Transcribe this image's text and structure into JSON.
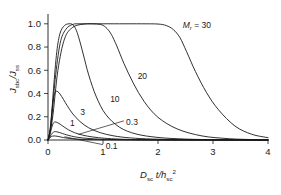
{
  "chart_data": {
    "type": "line",
    "title": "",
    "subtitle": "",
    "xlabel": "D_sc t/h_sc^2",
    "ylabel": "J_sbc/J_ss",
    "xlabel_parts": {
      "main1": "D",
      "sub1": "sc",
      "main2": "t/h",
      "sub2": "sc",
      "sup2": "2"
    },
    "ylabel_parts": {
      "main1": "J",
      "sub1": "sbc",
      "main2": "/J",
      "sub2": "ss"
    },
    "xlim": [
      0,
      4
    ],
    "ylim": [
      0,
      1.05
    ],
    "xticks": [
      "0",
      "1",
      "2",
      "3",
      "4"
    ],
    "xtick_values": [
      0,
      1,
      2,
      3,
      4
    ],
    "yticks": [
      "0.0",
      "0.2",
      "0.4",
      "0.6",
      "0.8",
      "1.0"
    ],
    "ytick_values": [
      0.0,
      0.2,
      0.4,
      0.6,
      0.8,
      1.0
    ],
    "grid": false,
    "legend_position": "inline-annotations",
    "legend_title": "M_r",
    "legend_title_parts": {
      "main": "M",
      "sub": "r"
    },
    "series": [
      {
        "name": "0.1",
        "label": "0.1",
        "peak": 0.035,
        "x": [
          0,
          0.02,
          0.05,
          0.08,
          0.11,
          0.14,
          0.18,
          0.22,
          0.28,
          0.35,
          0.45,
          0.6,
          0.8,
          1.0,
          1.3,
          1.7,
          2.2,
          2.8,
          3.4,
          4.0
        ],
        "values": [
          0,
          0.012,
          0.026,
          0.033,
          0.035,
          0.034,
          0.031,
          0.027,
          0.021,
          0.016,
          0.01,
          0.006,
          0.003,
          0.0015,
          0.0007,
          0.0003,
          0.0001,
          0.0001,
          0,
          0
        ]
      },
      {
        "name": "0.3",
        "label": "0.3",
        "peak": 0.072,
        "x": [
          0,
          0.03,
          0.06,
          0.1,
          0.14,
          0.18,
          0.23,
          0.3,
          0.38,
          0.48,
          0.62,
          0.8,
          1.0,
          1.3,
          1.6,
          2.0,
          2.5,
          3.0,
          3.5,
          4.0
        ],
        "values": [
          0,
          0.02,
          0.048,
          0.068,
          0.072,
          0.068,
          0.061,
          0.05,
          0.039,
          0.028,
          0.018,
          0.011,
          0.006,
          0.003,
          0.0015,
          0.0007,
          0.0003,
          0.0001,
          0,
          0
        ]
      },
      {
        "name": "1",
        "label": "1",
        "peak": 0.155,
        "x": [
          0,
          0.03,
          0.06,
          0.09,
          0.12,
          0.16,
          0.2,
          0.26,
          0.33,
          0.42,
          0.55,
          0.72,
          0.92,
          1.15,
          1.45,
          1.8,
          2.3,
          2.8,
          3.4,
          4.0
        ],
        "values": [
          0,
          0.035,
          0.095,
          0.138,
          0.155,
          0.152,
          0.142,
          0.123,
          0.1,
          0.076,
          0.052,
          0.033,
          0.02,
          0.011,
          0.005,
          0.0022,
          0.0008,
          0.0003,
          0.0001,
          0
        ]
      },
      {
        "name": "3",
        "label": "3",
        "peak": 0.42,
        "x": [
          0,
          0.03,
          0.06,
          0.09,
          0.12,
          0.15,
          0.18,
          0.22,
          0.28,
          0.35,
          0.45,
          0.58,
          0.74,
          0.95,
          1.2,
          1.5,
          1.9,
          2.4,
          3.0,
          3.6,
          4.0
        ],
        "values": [
          0,
          0.06,
          0.2,
          0.33,
          0.4,
          0.42,
          0.415,
          0.395,
          0.35,
          0.295,
          0.225,
          0.16,
          0.105,
          0.063,
          0.035,
          0.018,
          0.008,
          0.003,
          0.001,
          0.0002,
          0
        ]
      },
      {
        "name": "10",
        "label": "10",
        "peak": 1.0,
        "plateau_end": 0.42,
        "x": [
          0,
          0.05,
          0.1,
          0.16,
          0.22,
          0.3,
          0.38,
          0.44,
          0.5,
          0.56,
          0.64,
          0.74,
          0.88,
          1.05,
          1.3,
          1.6,
          2.0,
          2.5,
          3.1,
          3.6,
          4.0
        ],
        "values": [
          0,
          0.12,
          0.44,
          0.76,
          0.92,
          0.985,
          1.0,
          0.995,
          0.96,
          0.88,
          0.74,
          0.56,
          0.37,
          0.22,
          0.11,
          0.052,
          0.022,
          0.008,
          0.002,
          0.0005,
          0
        ]
      },
      {
        "name": "20",
        "label": "20",
        "peak": 1.0,
        "plateau_end": 1.0,
        "x": [
          0,
          0.06,
          0.13,
          0.22,
          0.32,
          0.45,
          0.6,
          0.8,
          0.95,
          1.05,
          1.15,
          1.25,
          1.38,
          1.55,
          1.75,
          2.0,
          2.35,
          2.8,
          3.3,
          3.7,
          4.0
        ],
        "values": [
          0,
          0.15,
          0.52,
          0.83,
          0.95,
          0.995,
          1.0,
          1.0,
          0.995,
          0.97,
          0.91,
          0.81,
          0.66,
          0.49,
          0.33,
          0.195,
          0.095,
          0.035,
          0.011,
          0.004,
          0.001
        ]
      },
      {
        "name": "30",
        "label": "M_r = 30",
        "peak": 1.0,
        "plateau_end": 2.15,
        "x": [
          0,
          0.08,
          0.18,
          0.3,
          0.45,
          0.65,
          0.9,
          1.3,
          1.7,
          2.0,
          2.15,
          2.28,
          2.4,
          2.52,
          2.68,
          2.88,
          3.1,
          3.4,
          3.7,
          4.0
        ],
        "values": [
          0,
          0.18,
          0.6,
          0.87,
          0.97,
          0.997,
          1.0,
          1.0,
          1.0,
          0.998,
          0.985,
          0.95,
          0.88,
          0.76,
          0.59,
          0.41,
          0.26,
          0.12,
          0.05,
          0.02
        ]
      }
    ],
    "annotations": [
      {
        "text": "M_r = 30",
        "x": 2.45,
        "y": 0.99,
        "leader": false
      },
      {
        "text": "20",
        "x": 1.63,
        "y": 0.555,
        "leader": false
      },
      {
        "text": "10",
        "x": 1.13,
        "y": 0.355,
        "leader": false
      },
      {
        "text": "3",
        "x": 0.585,
        "y": 0.24,
        "leader": false
      },
      {
        "text": "1",
        "x": 0.4,
        "y": 0.145,
        "leader": false
      },
      {
        "text": "0.3",
        "x": 1.42,
        "y": 0.155,
        "leader": true
      },
      {
        "text": "0.1",
        "x": 1.05,
        "y": -0.055,
        "leader": true
      }
    ]
  }
}
